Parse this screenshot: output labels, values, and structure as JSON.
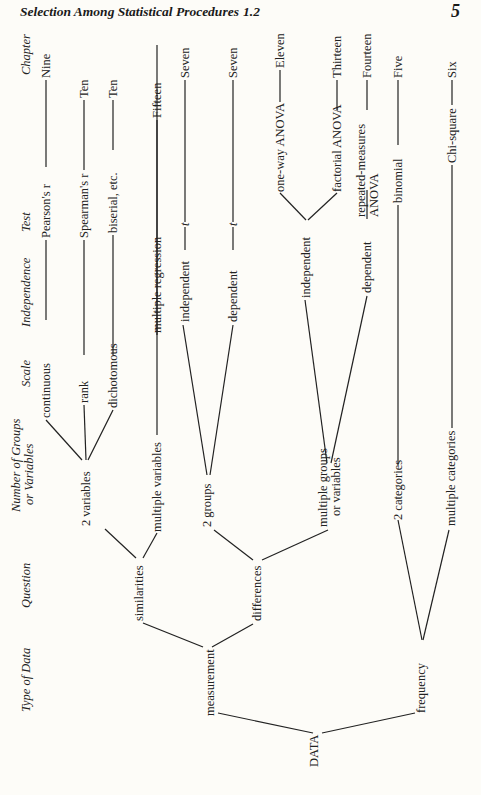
{
  "page": {
    "running_head": "Selection Among Statistical Procedures",
    "section": "1.2",
    "page_number": "5",
    "orientation": "rotated 90° counter-clockwise"
  },
  "diagram": {
    "column_headers": {
      "type_of_data": "Type of Data",
      "question": "Question",
      "groups_line1": "Number of Groups",
      "groups_line2": "or Variables",
      "scale": "Scale",
      "independence": "Independence",
      "test": "Test",
      "chapter": "Chapter"
    },
    "root": "DATA",
    "type_of_data": {
      "measurement": "measurement",
      "frequency": "frequency"
    },
    "question": {
      "similarities": "similarities",
      "differences": "differences"
    },
    "groups": {
      "two_variables": "2 variables",
      "multiple_variables": "multiple variables",
      "two_groups": "2 groups",
      "multiple_groups_line1": "multiple groups",
      "multiple_groups_line2": "or variables",
      "two_categories": "2 categories",
      "multiple_categories": "multiple categories"
    },
    "scale": {
      "continuous": "continuous",
      "rank": "rank",
      "dichotomous": "dichotomous"
    },
    "independence": {
      "independent_2g": "independent",
      "dependent_2g": "dependent",
      "independent_mg": "independent",
      "dependent_mg": "dependent"
    },
    "tests": {
      "pearson": "Pearson's r",
      "spearman": "Spearman's r",
      "biserial": "biserial, etc.",
      "multiple_regression": "multiple regression",
      "t_independent": "t",
      "t_dependent": "t",
      "oneway_anova": "one-way ANOVA",
      "factorial_anova": "factorial ANOVA",
      "repeated_line1": "repeated-measures",
      "repeated_line2": "ANOVA",
      "binomial": "binomial",
      "chi_square": "Chi-square"
    },
    "chapters": {
      "pearson": "Nine",
      "spearman": "Ten",
      "biserial": "Ten",
      "multiple_regression": "Fifteen",
      "t_independent": "Seven",
      "t_dependent": "Seven",
      "oneway_anova": "Eleven",
      "factorial_anova": "Thirteen",
      "repeated": "Fourteen",
      "binomial": "Five",
      "chi_square": "Six"
    },
    "paths": [
      [
        "DATA",
        "measurement",
        "similarities",
        "2 variables",
        "continuous",
        "Pearson's r",
        "Nine"
      ],
      [
        "DATA",
        "measurement",
        "similarities",
        "2 variables",
        "rank",
        "Spearman's r",
        "Ten"
      ],
      [
        "DATA",
        "measurement",
        "similarities",
        "2 variables",
        "dichotomous",
        "biserial, etc.",
        "Ten"
      ],
      [
        "DATA",
        "measurement",
        "similarities",
        "multiple variables",
        "multiple regression",
        "Fifteen"
      ],
      [
        "DATA",
        "measurement",
        "differences",
        "2 groups",
        "independent",
        "t",
        "Seven"
      ],
      [
        "DATA",
        "measurement",
        "differences",
        "2 groups",
        "dependent",
        "t",
        "Seven"
      ],
      [
        "DATA",
        "measurement",
        "differences",
        "multiple groups or variables",
        "independent",
        "one-way ANOVA",
        "Eleven"
      ],
      [
        "DATA",
        "measurement",
        "differences",
        "multiple groups or variables",
        "independent",
        "factorial ANOVA",
        "Thirteen"
      ],
      [
        "DATA",
        "measurement",
        "differences",
        "multiple groups or variables",
        "dependent",
        "repeated-measures ANOVA",
        "Fourteen"
      ],
      [
        "DATA",
        "frequency",
        "2 categories",
        "binomial",
        "Five"
      ],
      [
        "DATA",
        "frequency",
        "multiple categories",
        "Chi-square",
        "Six"
      ]
    ]
  }
}
